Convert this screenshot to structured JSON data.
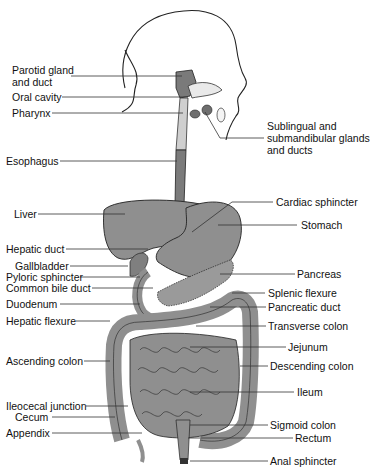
{
  "diagram": {
    "colors": {
      "organ_fill": "#8f8f8f",
      "organ_dark": "#6e6e6e",
      "outline": "#222222",
      "leader": "#333333",
      "background": "#ffffff"
    },
    "labels_left": [
      {
        "id": "parotid",
        "text": "Parotid gland\nand duct"
      },
      {
        "id": "oral-cavity",
        "text": "Oral cavity"
      },
      {
        "id": "pharynx",
        "text": "Pharynx"
      },
      {
        "id": "esophagus",
        "text": "Esophagus"
      },
      {
        "id": "liver",
        "text": "Liver"
      },
      {
        "id": "hepatic-duct",
        "text": "Hepatic duct"
      },
      {
        "id": "gallbladder",
        "text": "Gallbladder"
      },
      {
        "id": "pyloric-sphincter",
        "text": "Pyloric sphincter"
      },
      {
        "id": "common-bile-duct",
        "text": "Common bile duct"
      },
      {
        "id": "duodenum",
        "text": "Duodenum"
      },
      {
        "id": "hepatic-flexure",
        "text": "Hepatic flexure"
      },
      {
        "id": "ascending-colon",
        "text": "Ascending colon"
      },
      {
        "id": "ileocecal-junction",
        "text": "Ileocecal junction"
      },
      {
        "id": "cecum",
        "text": "Cecum"
      },
      {
        "id": "appendix",
        "text": "Appendix"
      }
    ],
    "labels_right": [
      {
        "id": "sublingual",
        "text": "Sublingual and\nsubmandibular glands\nand ducts"
      },
      {
        "id": "cardiac-sphincter",
        "text": "Cardiac sphincter"
      },
      {
        "id": "stomach",
        "text": "Stomach"
      },
      {
        "id": "pancreas",
        "text": "Pancreas"
      },
      {
        "id": "splenic-flexure",
        "text": "Splenic flexure"
      },
      {
        "id": "pancreatic-duct",
        "text": "Pancreatic duct"
      },
      {
        "id": "transverse-colon",
        "text": "Transverse colon"
      },
      {
        "id": "jejunum",
        "text": "Jejunum"
      },
      {
        "id": "descending-colon",
        "text": "Descending colon"
      },
      {
        "id": "ileum",
        "text": "Ileum"
      },
      {
        "id": "sigmoid-colon",
        "text": "Sigmoid colon"
      },
      {
        "id": "rectum",
        "text": "Rectum"
      },
      {
        "id": "anal-sphincter",
        "text": "Anal sphincter"
      }
    ]
  }
}
